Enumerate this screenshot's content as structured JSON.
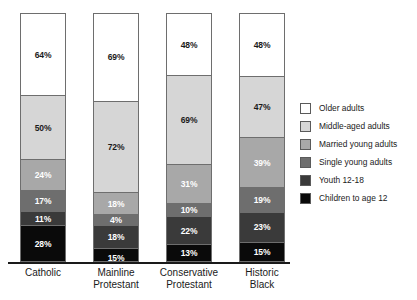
{
  "chart_data": {
    "type": "bar",
    "subtype": "stacked-bar-100",
    "title": "",
    "subtitle": "",
    "xlabel": "",
    "ylabel": "",
    "grid": false,
    "legend_position": "right",
    "ylim": [
      0,
      100
    ],
    "categories": [
      "Catholic",
      "Mainline Protestant",
      "Conservative Protestant",
      "Historic Black"
    ],
    "category_lines": [
      [
        "Catholic",
        ""
      ],
      [
        "Mainline",
        "Protestant"
      ],
      [
        "Conservative",
        "Protestant"
      ],
      [
        "Historic",
        "Black"
      ]
    ],
    "stack_order_top_to_bottom": [
      "Older adults",
      "Middle-aged adults",
      "Married young adults",
      "Single young adults",
      "Youth 12-18",
      "Children to age 12"
    ],
    "series": [
      {
        "name": "Older adults",
        "color": "#ffffff",
        "values": [
          64,
          69,
          48,
          48
        ],
        "labels": [
          "64%",
          "69%",
          "48%",
          "48%"
        ]
      },
      {
        "name": "Middle-aged adults",
        "color": "#d6d6d6",
        "values": [
          50,
          72,
          69,
          47
        ],
        "labels": [
          "50%",
          "72%",
          "69%",
          "47%"
        ]
      },
      {
        "name": "Married young adults",
        "color": "#a8a8a8",
        "values": [
          24,
          18,
          31,
          39
        ],
        "labels": [
          "24%",
          "18%",
          "31%",
          "39%"
        ]
      },
      {
        "name": "Single young adults",
        "color": "#6e6e6e",
        "values": [
          17,
          4,
          10,
          19
        ],
        "labels": [
          "17%",
          "4%",
          "10%",
          "19%"
        ]
      },
      {
        "name": "Youth 12-18",
        "color": "#3a3a3a",
        "values": [
          11,
          18,
          22,
          23
        ],
        "labels": [
          "11%",
          "18%",
          "22%",
          "23%"
        ]
      },
      {
        "name": "Children to age 12",
        "color": "#0a0a0a",
        "values": [
          28,
          15,
          13,
          15
        ],
        "labels": [
          "28%",
          "15%",
          "13%",
          "15%"
        ]
      }
    ],
    "bars": [
      {
        "category": "Catholic",
        "segments": [
          {
            "label": "64%",
            "value": 64,
            "series": "Older adults"
          },
          {
            "label": "50%",
            "value": 50,
            "series": "Middle-aged adults"
          },
          {
            "label": "24%",
            "value": 24,
            "series": "Married young adults"
          },
          {
            "label": "17%",
            "value": 17,
            "series": "Single young adults"
          },
          {
            "label": "11%",
            "value": 11,
            "series": "Youth 12-18"
          },
          {
            "label": "28%",
            "value": 28,
            "series": "Children to age 12"
          }
        ]
      },
      {
        "category": "Mainline Protestant",
        "segments": [
          {
            "label": "69%",
            "value": 69,
            "series": "Older adults"
          },
          {
            "label": "72%",
            "value": 72,
            "series": "Middle-aged adults"
          },
          {
            "label": "18%",
            "value": 18,
            "series": "Married young adults"
          },
          {
            "label": "4%",
            "value": 4,
            "series": "Single young adults"
          },
          {
            "label": "18%",
            "value": 18,
            "series": "Youth 12-18"
          },
          {
            "label": "15%",
            "value": 15,
            "series": "Children to age 12"
          }
        ]
      },
      {
        "category": "Conservative Protestant",
        "segments": [
          {
            "label": "48%",
            "value": 48,
            "series": "Older adults"
          },
          {
            "label": "69%",
            "value": 69,
            "series": "Middle-aged adults"
          },
          {
            "label": "31%",
            "value": 31,
            "series": "Married young adults"
          },
          {
            "label": "10%",
            "value": 10,
            "series": "Single young adults"
          },
          {
            "label": "22%",
            "value": 22,
            "series": "Youth 12-18"
          },
          {
            "label": "13%",
            "value": 13,
            "series": "Children to age 12"
          }
        ]
      },
      {
        "category": "Historic Black",
        "segments": [
          {
            "label": "48%",
            "value": 48,
            "series": "Older adults"
          },
          {
            "label": "47%",
            "value": 47,
            "series": "Middle-aged adults"
          },
          {
            "label": "39%",
            "value": 39,
            "series": "Married young adults"
          },
          {
            "label": "19%",
            "value": 19,
            "series": "Single young adults"
          },
          {
            "label": "23%",
            "value": 23,
            "series": "Youth 12-18"
          },
          {
            "label": "15%",
            "value": 15,
            "series": "Children to age 12"
          }
        ]
      }
    ],
    "legend": [
      {
        "label": "Older adults",
        "color": "#ffffff"
      },
      {
        "label": "Middle-aged adults",
        "color": "#d6d6d6"
      },
      {
        "label": "Married young adults",
        "color": "#a8a8a8"
      },
      {
        "label": "Single young adults",
        "color": "#6e6e6e"
      },
      {
        "label": "Youth 12-18",
        "color": "#3a3a3a"
      },
      {
        "label": "Children to age 12",
        "color": "#0a0a0a"
      }
    ]
  },
  "colors": {
    "background": "#ffffff",
    "text": "#1a1a1a",
    "axis": "#1a1a1a",
    "bar_outline": "#6e6e6e"
  }
}
